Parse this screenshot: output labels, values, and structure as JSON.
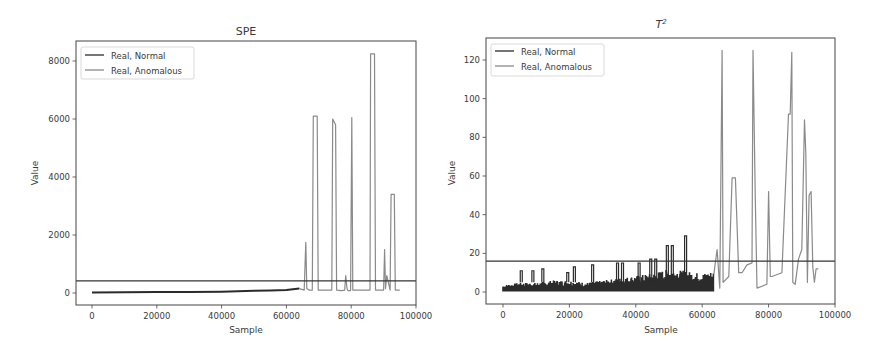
{
  "chart_data": [
    {
      "type": "line",
      "title": "SPE",
      "xlabel": "Sample",
      "ylabel": "Value",
      "xlim": [
        -4000,
        100000
      ],
      "ylim": [
        -450,
        8650
      ],
      "xticks": [
        0,
        20000,
        40000,
        60000,
        80000,
        100000
      ],
      "xtick_labels": [
        "0",
        "20000",
        "40000",
        "60000",
        "80000",
        "100000"
      ],
      "yticks": [
        0,
        2000,
        4000,
        6000,
        8000
      ],
      "ytick_labels": [
        "0",
        "2000",
        "4000",
        "6000",
        "8000"
      ],
      "grid": false,
      "legend": {
        "position": "upper left",
        "entries": [
          "Real, Normal",
          "Real, Anomalous"
        ]
      },
      "threshold": 420,
      "series": [
        {
          "name": "Real, Normal",
          "color": "#2b2b2b",
          "x": [
            0,
            10000,
            20000,
            30000,
            40000,
            45000,
            50000,
            55000,
            60000,
            62000,
            64000
          ],
          "y": [
            20,
            25,
            30,
            35,
            45,
            60,
            80,
            90,
            100,
            130,
            150
          ]
        },
        {
          "name": "Real, Anomalous",
          "color": "#8a8a8a",
          "x": [
            64000,
            65500,
            66000,
            66300,
            67000,
            68000,
            68300,
            69500,
            69800,
            72000,
            74000,
            74300,
            75200,
            75500,
            77000,
            78000,
            78300,
            78700,
            79000,
            79800,
            80200,
            80500,
            81000,
            83000,
            85800,
            86000,
            87200,
            87500,
            89000,
            90000,
            90300,
            90600,
            91000,
            92000,
            92300,
            93300,
            93600,
            95000
          ],
          "y": [
            150,
            100,
            1750,
            150,
            100,
            100,
            6100,
            6100,
            100,
            100,
            100,
            6000,
            5800,
            100,
            80,
            100,
            600,
            150,
            80,
            80,
            6050,
            100,
            100,
            100,
            100,
            8250,
            8250,
            100,
            100,
            100,
            1500,
            150,
            600,
            100,
            3400,
            3400,
            100,
            100
          ]
        }
      ]
    },
    {
      "type": "line",
      "title": "T²",
      "xlabel": "Sample",
      "ylabel": "Value",
      "xlim": [
        -4000,
        100000
      ],
      "ylim": [
        -6,
        131
      ],
      "xticks": [
        0,
        20000,
        40000,
        60000,
        80000,
        100000
      ],
      "xtick_labels": [
        "0",
        "20000",
        "40000",
        "60000",
        "80000",
        "100000"
      ],
      "yticks": [
        0,
        20,
        40,
        60,
        80,
        100,
        120
      ],
      "ytick_labels": [
        "0",
        "20",
        "40",
        "60",
        "80",
        "100",
        "120"
      ],
      "grid": false,
      "legend": {
        "position": "upper left",
        "entries": [
          "Real, Normal",
          "Real, Anomalous"
        ]
      },
      "threshold": 16,
      "series": [
        {
          "name": "Real, Normal",
          "color": "#2b2b2b",
          "x": [
            0,
            5000,
            10000,
            15000,
            20000,
            25000,
            30000,
            35000,
            40000,
            45000,
            50000,
            55000,
            60000,
            63500
          ],
          "y": [
            3,
            4,
            4,
            5,
            5,
            4,
            5,
            6,
            7,
            8,
            10,
            9,
            8,
            9
          ],
          "spikes": [
            [
              5500,
              11
            ],
            [
              9000,
              11
            ],
            [
              12000,
              12
            ],
            [
              19500,
              10
            ],
            [
              21500,
              13
            ],
            [
              27000,
              14
            ],
            [
              34500,
              15
            ],
            [
              36000,
              15
            ],
            [
              41000,
              15
            ],
            [
              44500,
              17
            ],
            [
              46000,
              17
            ],
            [
              49500,
              24
            ],
            [
              51000,
              24
            ],
            [
              55000,
              29
            ]
          ]
        },
        {
          "name": "Real, Anomalous",
          "color": "#8a8a8a",
          "x": [
            63500,
            64500,
            65300,
            66000,
            66300,
            68000,
            69000,
            70000,
            71000,
            72000,
            73500,
            75000,
            75300,
            76000,
            76500,
            78000,
            79500,
            80000,
            80500,
            81000,
            84000,
            86000,
            86500,
            87000,
            87300,
            88000,
            89000,
            90000,
            90800,
            91200,
            91700,
            92200,
            92800,
            93300,
            93800,
            94300,
            95000
          ],
          "y": [
            9,
            22,
            2,
            125,
            5,
            8,
            59,
            59,
            10,
            10,
            14,
            15,
            125,
            48,
            2,
            3,
            4,
            52,
            8,
            8,
            10,
            92,
            92,
            124,
            5,
            4,
            17,
            22,
            89,
            72,
            5,
            50,
            52,
            13,
            5,
            12,
            12
          ]
        }
      ]
    }
  ]
}
